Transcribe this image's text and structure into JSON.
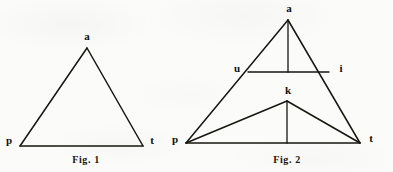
{
  "page": {
    "background_color": "#fbfbfa",
    "ink_color": "#17160f",
    "width": 393,
    "height": 172
  },
  "figures": [
    {
      "id": "fig-1",
      "caption": "Fig. 1",
      "caption_pos": {
        "x": 86,
        "y": 159
      },
      "description": "Isoceles triangle with apex a and base vertices p and t",
      "vertices": [
        {
          "name": "a",
          "label": "a",
          "point": {
            "x": 87,
            "y": 48
          },
          "label_pos": {
            "x": 87,
            "y": 36
          }
        },
        {
          "name": "p",
          "label": "p",
          "point": {
            "x": 20,
            "y": 146
          },
          "label_pos": {
            "x": 9,
            "y": 140
          }
        },
        {
          "name": "t",
          "label": "t",
          "point": {
            "x": 143,
            "y": 146
          },
          "label_pos": {
            "x": 152,
            "y": 140
          }
        }
      ],
      "edges": [
        {
          "name": "edge-p-a",
          "from": "p",
          "to": "a"
        },
        {
          "name": "edge-a-t",
          "from": "a",
          "to": "t"
        },
        {
          "name": "edge-p-t",
          "from": "p",
          "to": "t"
        }
      ]
    },
    {
      "id": "fig-2",
      "caption": "Fig. 2",
      "caption_pos": {
        "x": 287,
        "y": 159
      },
      "description": "Triangle p-a-t subdivided: horizontal chord u-i, inner triangle p-k-t, and vertical altitudes from a and k",
      "vertices": [
        {
          "name": "a",
          "label": "a",
          "point": {
            "x": 288,
            "y": 20
          },
          "label_pos": {
            "x": 289,
            "y": 8
          }
        },
        {
          "name": "u",
          "label": "u",
          "point": {
            "x": 248,
            "y": 72
          },
          "label_pos": {
            "x": 237,
            "y": 68
          }
        },
        {
          "name": "i",
          "label": "i",
          "point": {
            "x": 329,
            "y": 72
          },
          "label_pos": {
            "x": 341,
            "y": 68
          }
        },
        {
          "name": "k",
          "label": "k",
          "point": {
            "x": 287,
            "y": 101
          },
          "label_pos": {
            "x": 288,
            "y": 90
          }
        },
        {
          "name": "p",
          "label": "p",
          "point": {
            "x": 186,
            "y": 143
          },
          "label_pos": {
            "x": 175,
            "y": 139
          }
        },
        {
          "name": "t",
          "label": "t",
          "point": {
            "x": 360,
            "y": 143
          },
          "label_pos": {
            "x": 371,
            "y": 138
          }
        }
      ],
      "edges": [
        {
          "name": "edge-p-a",
          "from": "p",
          "to": "a"
        },
        {
          "name": "edge-a-t",
          "from": "a",
          "to": "t"
        },
        {
          "name": "edge-p-t",
          "from": "p",
          "to": "t"
        },
        {
          "name": "edge-u-i",
          "from": "u",
          "to": "i"
        },
        {
          "name": "edge-p-k",
          "from": "p",
          "to": "k"
        },
        {
          "name": "edge-k-t",
          "from": "k",
          "to": "t"
        },
        {
          "name": "altitude-a",
          "from": "a",
          "to": "base-foot-a"
        },
        {
          "name": "altitude-k",
          "from": "k",
          "to": "base-foot-k"
        }
      ]
    }
  ]
}
